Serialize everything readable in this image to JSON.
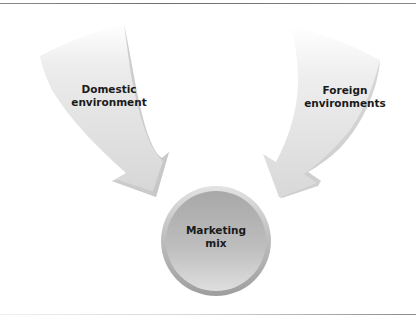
{
  "diagram": {
    "title": "",
    "nodes": [
      {
        "id": "domestic",
        "label_line1": "Domestic",
        "label_line2": "environment",
        "shape": "curved-arrow"
      },
      {
        "id": "foreign",
        "label_line1": "Foreign",
        "label_line2": "environments",
        "shape": "curved-arrow"
      },
      {
        "id": "mix",
        "label_line1": "Marketing",
        "label_line2": "mix",
        "shape": "circle"
      }
    ],
    "edges": [
      {
        "from": "domestic",
        "to": "mix"
      },
      {
        "from": "foreign",
        "to": "mix"
      }
    ],
    "colors": {
      "arrow_fill": "#dcdcdc",
      "arrow_shadow": "#b8b8b8",
      "circle_fill": "#b0b0b0",
      "circle_rim": "#cfcfcf",
      "text": "#1a1a1a",
      "rule": "#7a7a7a"
    }
  }
}
